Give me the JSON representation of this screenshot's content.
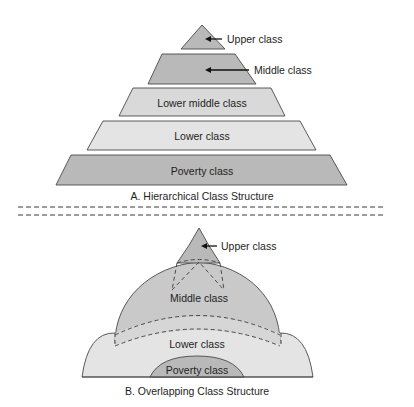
{
  "diagram": {
    "colors": {
      "dark_fill": "#b9b9b9",
      "light_fill": "#d9d9d9",
      "lightest_fill": "#e4e4e4",
      "stroke": "#4a4a4a",
      "text": "#1e1e1e"
    },
    "hierarchical": {
      "caption": "A. Hierarchical Class Structure",
      "layers": [
        {
          "label": "Upper class",
          "labeled_with_arrow": true
        },
        {
          "label": "Middle class",
          "labeled_with_arrow": true
        },
        {
          "label": "Lower middle class",
          "labeled_with_arrow": false
        },
        {
          "label": "Lower class",
          "labeled_with_arrow": false
        },
        {
          "label": "Poverty class",
          "labeled_with_arrow": false
        }
      ]
    },
    "overlapping": {
      "caption": "B. Overlapping Class Structure",
      "layers": [
        {
          "label": "Upper class",
          "labeled_with_arrow": true
        },
        {
          "label": "Middle class",
          "labeled_with_arrow": false
        },
        {
          "label": "Lower class",
          "labeled_with_arrow": false
        },
        {
          "label": "Poverty class",
          "labeled_with_arrow": false
        }
      ]
    }
  }
}
